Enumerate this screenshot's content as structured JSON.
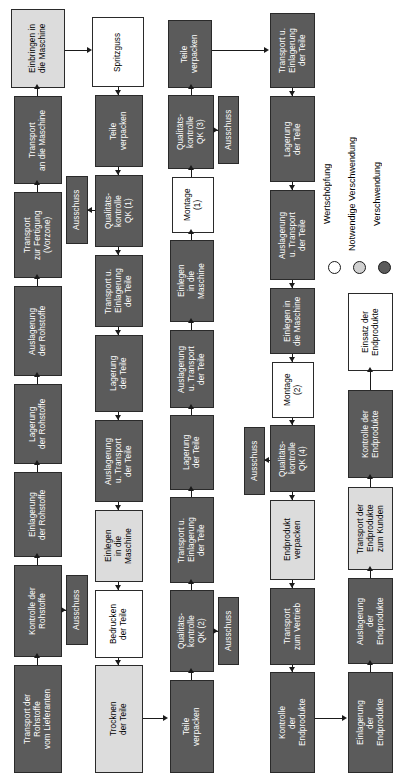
{
  "diagram": {
    "orientation": "rotated-90",
    "colors": {
      "value_add": "#ffffff",
      "necessary_waste": "#dcdcdc",
      "waste": "#5b5b5b",
      "outline": "#1a1a1a"
    }
  },
  "legend": {
    "items": [
      {
        "label": "Wertschöpfung",
        "swatch": "#ffffff",
        "category": "value_add"
      },
      {
        "label": "Notwendige Verschwendung",
        "swatch": "#dcdcdc",
        "category": "necessary_waste"
      },
      {
        "label": "Verschwendung",
        "swatch": "#5b5b5b",
        "category": "waste"
      }
    ]
  },
  "nodes": {
    "c1_transport_lieferant": {
      "label": "Transport der\nRohstoffe\nvom Lieferanten",
      "category": "waste"
    },
    "c1_kontrolle_rohstoffe": {
      "label": "Kontrolle der\nRohstoffe",
      "category": "waste"
    },
    "c1_ausschuss": {
      "label": "Ausschuss",
      "category": "waste"
    },
    "c1_einlagerung_rohstoffe": {
      "label": "Einlagerung\nder Rohstoffe",
      "category": "waste"
    },
    "c1_lagerung_rohstoffe": {
      "label": "Lagerung\nder Rohstoffe",
      "category": "waste"
    },
    "c1_auslagerung_rohstoffe": {
      "label": "Auslagerung\nder Rohstoffe",
      "category": "waste"
    },
    "c1_transport_fertigung": {
      "label": "Transport\nzur Fertigung\n(Vorzone)",
      "category": "waste"
    },
    "c1_transport_maschine": {
      "label": "Transport\nan die Maschine",
      "category": "waste"
    },
    "c1_einbringen_maschine": {
      "label": "Einbringen in\ndie Maschine",
      "category": "necessary_waste"
    },
    "c2_spritzguss": {
      "label": "Spritzguss",
      "category": "value_add"
    },
    "c2_teile_verpacken": {
      "label": "Teile\nverpacken",
      "category": "waste"
    },
    "c2_qk1": {
      "label": "Qualitäts-\nkontrolle\nQK (1)",
      "category": "waste"
    },
    "c2_ausschuss": {
      "label": "Ausschuss",
      "category": "waste"
    },
    "c2_transport_einlagerung": {
      "label": "Transport u.\nEinlagerung\nder Teile",
      "category": "waste"
    },
    "c2_lagerung_teile": {
      "label": "Lagerung\nder Teile",
      "category": "waste"
    },
    "c2_auslagerung_transport": {
      "label": "Auslagerung\nu. Transport\nder Teile",
      "category": "waste"
    },
    "c2_einlegen_maschine": {
      "label": "Einlegen\nin die\nMaschine",
      "category": "necessary_waste"
    },
    "c2_bedrucken": {
      "label": "Bedrucken\nder Teile",
      "category": "value_add"
    },
    "c2_trocknen": {
      "label": "Trocknen\nder Teile",
      "category": "necessary_waste"
    },
    "c3_teile_verpacken_b": {
      "label": "Teile\nverpacken",
      "category": "waste"
    },
    "c3_qk2": {
      "label": "Qualitäts-\nkontrolle\nQK (2)",
      "category": "waste"
    },
    "c3_ausschuss": {
      "label": "Ausschuss",
      "category": "waste"
    },
    "c3_transport_einlagerung": {
      "label": "Transport u.\nEinlagerung\nder Teile",
      "category": "waste"
    },
    "c3_lagerung_teile": {
      "label": "Lagerung\nder Teile",
      "category": "waste"
    },
    "c3_auslagerung_transport": {
      "label": "Auslagerung\nu. Transport\nder Teile",
      "category": "waste"
    },
    "c3_einlegen_maschine": {
      "label": "Einlegen\nin die\nMaschine",
      "category": "waste"
    },
    "c3_montage1": {
      "label": "Montage\n(1)",
      "category": "value_add"
    },
    "c3_qk3": {
      "label": "Qualitäts-\nkontrolle\nQK (3)",
      "category": "waste"
    },
    "c3_ausschuss_top": {
      "label": "Ausschuss",
      "category": "waste"
    },
    "c3_teile_verpacken_t": {
      "label": "Teile\nverpacken",
      "category": "waste"
    },
    "c4_transport_einlagerung": {
      "label": "Transport u.\nEinlagerung\nder Teile",
      "category": "waste"
    },
    "c4_lagerung_teile": {
      "label": "Lagerung\nder Teile",
      "category": "waste"
    },
    "c4_auslagerung_transport": {
      "label": "Auslagerung\nu. Transport\nder Teile",
      "category": "waste"
    },
    "c4_einlegen_maschine": {
      "label": "Einlegen in\ndie Maschine",
      "category": "waste"
    },
    "c4_montage2": {
      "label": "Montage\n(2)",
      "category": "value_add"
    },
    "c4_qk4": {
      "label": "Qualitäts-\nkontrolle\nQK (4)",
      "category": "waste"
    },
    "c4_ausschuss": {
      "label": "Ausschuss",
      "category": "waste"
    },
    "c4_endprodukt_verpacken": {
      "label": "Endprodukt\nverpacken",
      "category": "necessary_waste"
    },
    "c4_transport_vertrieb": {
      "label": "Transport\nzum Vertrieb",
      "category": "waste"
    },
    "c4_kontrolle_endprodukte": {
      "label": "Kontrolle\nder\nEndprodukte",
      "category": "waste"
    },
    "c5_einlagerung_endprodukte": {
      "label": "Einlagerung\nder\nEndprodukte",
      "category": "waste"
    },
    "c5_auslagerung_endprodukte": {
      "label": "Auslagerung\nder\nEndprodukte",
      "category": "waste"
    },
    "c5_transport_kunden": {
      "label": "Transport der\nEndprodukte\nzum Kunden",
      "category": "necessary_waste"
    },
    "c5_kontrolle_endprodukte": {
      "label": "Kontrolle der\nEndprodukte",
      "category": "waste"
    },
    "c5_einsatz_endprodukte": {
      "label": "Einsatz der\nEndprodukte",
      "category": "value_add"
    }
  }
}
